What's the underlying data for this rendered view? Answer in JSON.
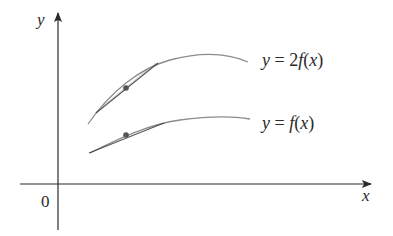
{
  "figure": {
    "type": "function-graph",
    "axes": {
      "x_label": "x",
      "y_label": "y",
      "origin_label": "0"
    },
    "curves": [
      {
        "id": "scaled",
        "label": "y = 2f(x)",
        "label_parts": {
          "lhs": "y",
          "eq": " = ",
          "coef": "2",
          "fn": "f",
          "arg_open": "(",
          "arg": "x",
          "arg_close": ")"
        },
        "has_tangent": true,
        "marked_point": true
      },
      {
        "id": "base",
        "label": "y = f(x)",
        "label_parts": {
          "lhs": "y",
          "eq": " = ",
          "fn": "f",
          "arg_open": "(",
          "arg": "x",
          "arg_close": ")"
        },
        "has_tangent": true,
        "marked_point": true
      }
    ],
    "colors": {
      "axis": "#2a2a2a",
      "curve": "#8c8c8c",
      "tangent": "#3a3a3a",
      "point": "#555555",
      "text": "#2a2a2a"
    }
  }
}
